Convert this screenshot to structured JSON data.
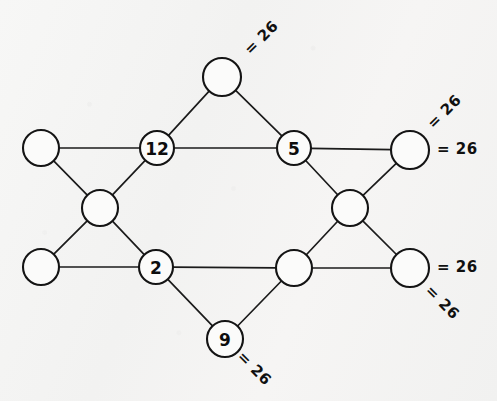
{
  "diagram": {
    "type": "graph",
    "background_color": "#f5f5f4",
    "stroke_color": "#141414",
    "node_fill_color": "#fbfbfa",
    "nodes": [
      {
        "id": "top",
        "label": "",
        "cx": 222,
        "cy": 77,
        "r": 19
      },
      {
        "id": "left-upper",
        "label": "",
        "cx": 41,
        "cy": 148,
        "r": 18
      },
      {
        "id": "twelve",
        "label": "12",
        "cx": 157,
        "cy": 148,
        "r": 17
      },
      {
        "id": "five",
        "label": "5",
        "cx": 294,
        "cy": 148,
        "r": 17
      },
      {
        "id": "right-upper",
        "label": "",
        "cx": 410,
        "cy": 150,
        "r": 19
      },
      {
        "id": "left-middle",
        "label": "",
        "cx": 100,
        "cy": 208,
        "r": 18
      },
      {
        "id": "right-middle",
        "label": "",
        "cx": 350,
        "cy": 208,
        "r": 18
      },
      {
        "id": "left-lower",
        "label": "",
        "cx": 41,
        "cy": 267,
        "r": 18
      },
      {
        "id": "two",
        "label": "2",
        "cx": 156,
        "cy": 267,
        "r": 17
      },
      {
        "id": "bottom-mid",
        "label": "",
        "cx": 294,
        "cy": 268,
        "r": 18
      },
      {
        "id": "right-lower",
        "label": "",
        "cx": 410,
        "cy": 268,
        "r": 19
      },
      {
        "id": "nine",
        "label": "9",
        "cx": 225,
        "cy": 339,
        "r": 18
      }
    ],
    "edges": [
      {
        "from": "top",
        "to": "twelve"
      },
      {
        "from": "top",
        "to": "five"
      },
      {
        "from": "left-upper",
        "to": "twelve"
      },
      {
        "from": "left-upper",
        "to": "left-middle"
      },
      {
        "from": "twelve",
        "to": "five"
      },
      {
        "from": "twelve",
        "to": "left-middle"
      },
      {
        "from": "five",
        "to": "right-upper"
      },
      {
        "from": "five",
        "to": "right-middle"
      },
      {
        "from": "right-upper",
        "to": "right-middle"
      },
      {
        "from": "left-middle",
        "to": "left-lower"
      },
      {
        "from": "left-middle",
        "to": "two"
      },
      {
        "from": "right-middle",
        "to": "bottom-mid"
      },
      {
        "from": "right-middle",
        "to": "right-lower"
      },
      {
        "from": "left-lower",
        "to": "two"
      },
      {
        "from": "two",
        "to": "bottom-mid"
      },
      {
        "from": "two",
        "to": "nine"
      },
      {
        "from": "bottom-mid",
        "to": "right-lower"
      },
      {
        "from": "bottom-mid",
        "to": "nine"
      }
    ],
    "sum_labels": [
      {
        "id": "sum-top",
        "text": "= 26",
        "x": 247,
        "y": 52,
        "rotation": -45
      },
      {
        "id": "sum-right-upper",
        "text": "= 26",
        "x": 430,
        "y": 126,
        "rotation": -45
      },
      {
        "id": "sum-right-middle",
        "text": "= 26",
        "x": 437,
        "y": 149,
        "rotation": 0
      },
      {
        "id": "sum-right-lower",
        "text": "= 26",
        "x": 437,
        "y": 267,
        "rotation": 0
      },
      {
        "id": "sum-right-bottom",
        "text": "= 26",
        "x": 428,
        "y": 288,
        "rotation": 45
      },
      {
        "id": "sum-bottom",
        "text": "= 26",
        "x": 240,
        "y": 354,
        "rotation": 45
      }
    ]
  }
}
